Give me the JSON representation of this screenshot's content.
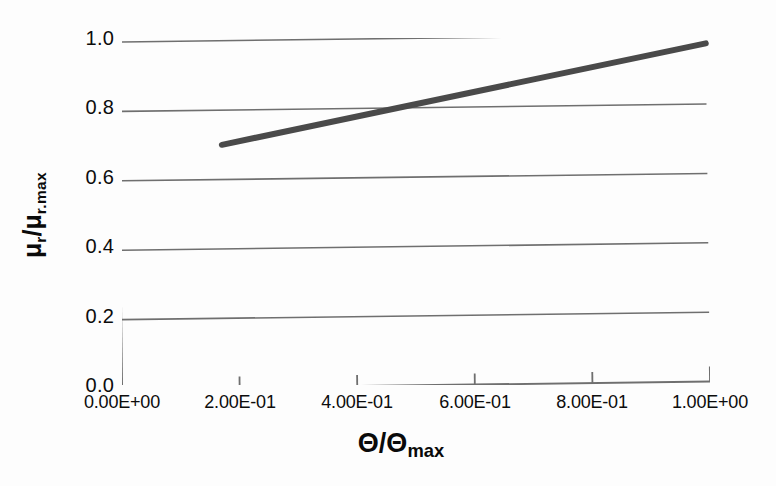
{
  "chart_data": {
    "type": "line",
    "title": "",
    "xlabel": "Θ/Θmax",
    "ylabel": "μr/μr.max",
    "xlabel_base": "Θ/Θ",
    "xlabel_sub": "max",
    "ylabel_base": "μ",
    "ylabel_sub1": "r",
    "ylabel_mid": "/μ",
    "ylabel_sub2": "r.max",
    "xlim": [
      0.0,
      1.0
    ],
    "ylim": [
      0.0,
      1.0
    ],
    "grid": "horizontal",
    "legend": "none",
    "x_tick_values": [
      0.0,
      0.2,
      0.4,
      0.6,
      0.8,
      1.0
    ],
    "x_tick_labels": [
      "0.00E+00",
      "2.00E-01",
      "4.00E-01",
      "6.00E-01",
      "8.00E-01",
      "1.00E+00"
    ],
    "y_tick_values": [
      0.0,
      0.2,
      0.4,
      0.6,
      0.8,
      1.0
    ],
    "y_tick_labels": [
      "0.0",
      "0.2",
      "0.4",
      "0.6",
      "0.8",
      "1.0"
    ],
    "series": [
      {
        "name": "mu_r ratio",
        "color": "#4a4a4a",
        "line_width": 6,
        "x": [
          0.175,
          1.0
        ],
        "y": [
          0.7,
          0.975
        ]
      }
    ],
    "colors": {
      "axis": "#6f6f6f",
      "grid": "#6f6f6f",
      "line": "#4a4a4a",
      "text": "#0c0c0c",
      "background": "#fdfdfd"
    }
  }
}
